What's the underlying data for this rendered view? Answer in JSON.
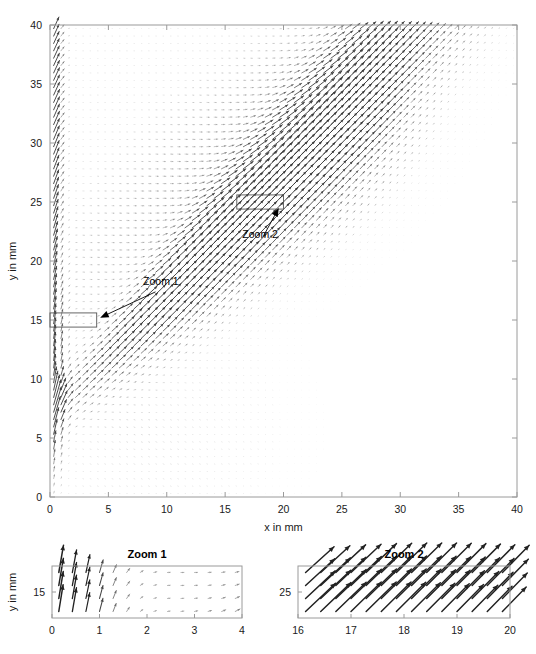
{
  "figure": {
    "type": "quiver-vector-field",
    "background_color": "#ffffff",
    "axis_color": "#9a9a9a",
    "arrow_color": "#333333",
    "annotation_color": "#000000"
  },
  "chart_data": {
    "type": "scatter",
    "subtype": "quiver",
    "title": "",
    "xlabel": "x in mm",
    "ylabel": "y in mm",
    "xlim": [
      0,
      40
    ],
    "ylim": [
      0,
      40
    ],
    "xticks": [
      0,
      5,
      10,
      15,
      20,
      25,
      30,
      35,
      40
    ],
    "yticks": [
      0,
      5,
      10,
      15,
      20,
      25,
      30,
      35,
      40
    ],
    "xtick_labels": [
      "0",
      "5",
      "10",
      "15",
      "20",
      "25",
      "30",
      "35",
      "40"
    ],
    "ytick_labels": [
      "0",
      "5",
      "10",
      "15",
      "20",
      "25",
      "30",
      "35",
      "40"
    ],
    "grid": false,
    "legend": "none",
    "grid_nx": 64,
    "grid_ny": 64,
    "annotations": [
      {
        "name": "Zoom 1",
        "label": "Zoom 1",
        "label_x": 9.5,
        "label_y": 17.6,
        "arrow_tip_x": 4.3,
        "arrow_tip_y": 15.2,
        "roi": {
          "x0": 0,
          "x1": 4,
          "y0": 14.4,
          "y1": 15.6
        }
      },
      {
        "name": "Zoom 2",
        "label": "Zoom 2",
        "label_x": 18.0,
        "label_y": 21.6,
        "arrow_tip_x": 19.6,
        "arrow_tip_y": 24.5,
        "roi": {
          "x0": 16,
          "x1": 20,
          "y0": 24.4,
          "y1": 25.6
        }
      }
    ]
  },
  "insets": [
    {
      "id": "zoom1",
      "title": "Zoom 1",
      "xlabel": "",
      "ylabel": "y in mm",
      "xlim": [
        0,
        4
      ],
      "ylim": [
        14.4,
        15.6
      ],
      "xticks": [
        0,
        1,
        2,
        3,
        4
      ],
      "xtick_labels": [
        "0",
        "1",
        "2",
        "3",
        "4"
      ],
      "yticks": [
        15
      ],
      "ytick_labels": [
        "15"
      ],
      "grid_nx": 14,
      "grid_ny": 4,
      "description": "Near-wall region: near-vertical upward arrows for x below 2 mm, progressively rotating clockwise to short down-right arrows by x = 4 mm."
    },
    {
      "id": "zoom2",
      "title": "Zoom 2",
      "xlabel": "",
      "ylabel": "",
      "xlim": [
        16,
        20
      ],
      "ylim": [
        24.4,
        25.6
      ],
      "xticks": [
        16,
        17,
        18,
        19,
        20
      ],
      "xtick_labels": [
        "16",
        "17",
        "18",
        "19",
        "20"
      ],
      "yticks": [
        25
      ],
      "ytick_labels": [
        "25"
      ],
      "grid_nx": 14,
      "grid_ny": 4,
      "description": "Shear-layer region: uniform arrows pointing up and to the right at roughly 45 degrees, magnitude increasing towards larger x."
    }
  ]
}
